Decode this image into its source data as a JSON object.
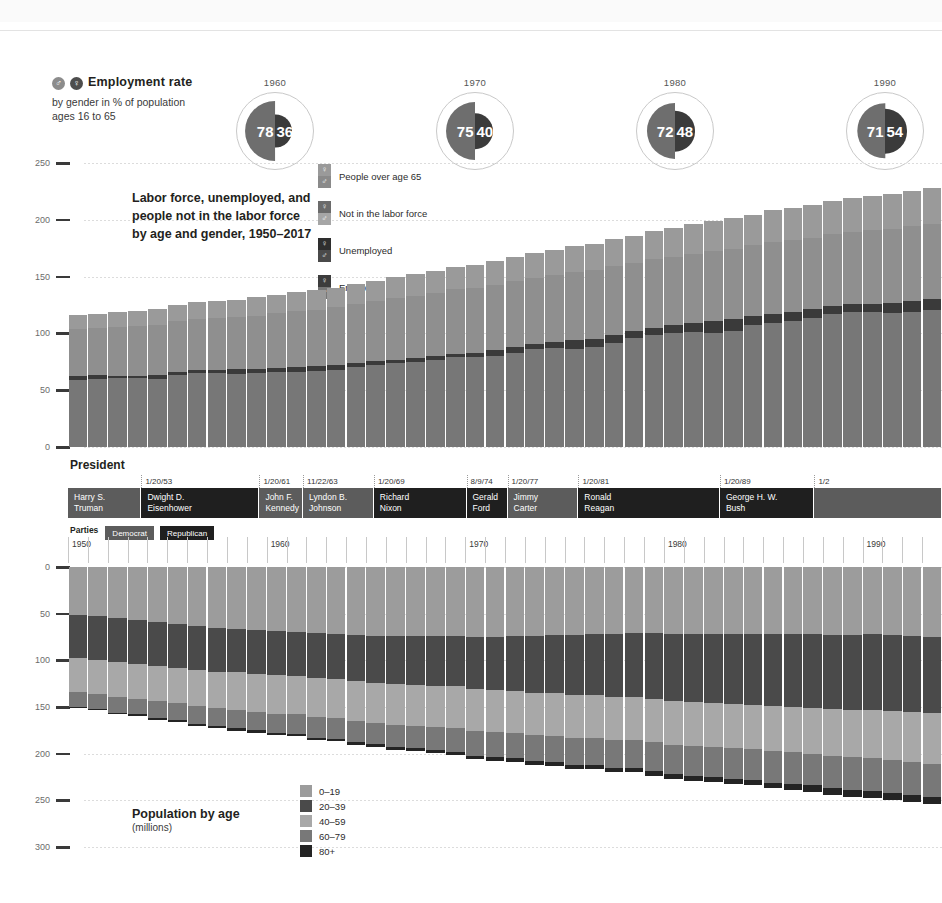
{
  "top_strip": {
    "ghost_text": ""
  },
  "employment": {
    "title": "Employment rate",
    "subtitle_line1": "by gender in % of population",
    "subtitle_line2": "ages 16 to 65",
    "male_icon": "♂",
    "female_icon": "♀",
    "male_color": "#6e6e6e",
    "female_color": "#3b3b3b",
    "entries": [
      {
        "year": "1960",
        "male": "78",
        "female": "36",
        "left": 229
      },
      {
        "year": "1970",
        "male": "75",
        "female": "40",
        "left": 429
      },
      {
        "year": "1980",
        "male": "72",
        "female": "48",
        "left": 629
      },
      {
        "year": "1990",
        "male": "71",
        "female": "54",
        "left": 839
      }
    ]
  },
  "top_chart": {
    "title_line1": "Labor force, unemployed, and",
    "title_line2": "people not in the labor force",
    "title_line3": "by age and gender, 1950–2017",
    "y_ticks": [
      "250",
      "200",
      "150",
      "100",
      "50",
      "0"
    ],
    "legend": [
      {
        "label": "People over age 65",
        "female_color": "#9a9a9a",
        "male_color": "#8a8a8a",
        "female_icon": "♀",
        "male_icon": "♂"
      },
      {
        "label": "Not in the labor force",
        "female_color": "#6b6b6b",
        "male_color": "#a6a6a6",
        "female_icon": "♀",
        "male_icon": "♂"
      },
      {
        "label": "Unemployed",
        "female_color": "#2e2e2e",
        "male_color": "#4a4a4a",
        "female_icon": "♀",
        "male_icon": "♂"
      },
      {
        "label": "Employed",
        "female_color": "#3c3c3c",
        "male_color": "#777777",
        "female_icon": "♀",
        "male_icon": "♂"
      }
    ]
  },
  "president": {
    "section_label": "President",
    "parties_label": "Parties",
    "party_legend": [
      {
        "name": "Democrat",
        "color": "#5c5c5c"
      },
      {
        "name": "Republican",
        "color": "#1f1f1f"
      }
    ],
    "terms": [
      {
        "name_line1": "Harry S.",
        "name_line2": "Truman",
        "party": "dem",
        "start_date": "",
        "width": 8.4
      },
      {
        "name_line1": "Dwight D.",
        "name_line2": "Eisenhower",
        "party": "rep",
        "start_date": "1/20/53",
        "width": 13.5
      },
      {
        "name_line1": "John F.",
        "name_line2": "Kennedy",
        "party": "dem",
        "start_date": "1/20/61",
        "width": 5.0
      },
      {
        "name_line1": "Lyndon B.",
        "name_line2": "Johnson",
        "party": "dem",
        "start_date": "11/22/63",
        "width": 8.1
      },
      {
        "name_line1": "Richard",
        "name_line2": "Nixon",
        "party": "rep",
        "start_date": "1/20/69",
        "width": 10.6
      },
      {
        "name_line1": "Gerald",
        "name_line2": "Ford",
        "party": "rep",
        "start_date": "8/9/74",
        "width": 4.7
      },
      {
        "name_line1": "Jimmy",
        "name_line2": "Carter",
        "party": "dem",
        "start_date": "1/20/77",
        "width": 8.1
      },
      {
        "name_line1": "Ronald",
        "name_line2": "Reagan",
        "party": "rep",
        "start_date": "1/20/81",
        "width": 16.2
      },
      {
        "name_line1": "George H. W.",
        "name_line2": "Bush",
        "party": "rep",
        "start_date": "1/20/89",
        "width": 10.8
      },
      {
        "name_line1": "",
        "name_line2": "",
        "party": "dem",
        "start_date": "1/2",
        "width": 14.6
      }
    ]
  },
  "bottom_chart": {
    "title": "Population by age",
    "units": "(millions)",
    "y_ticks": [
      "0",
      "50",
      "100",
      "150",
      "200",
      "250",
      "300"
    ],
    "decade_labels": [
      "1950",
      "1960",
      "1970",
      "1980",
      "1990"
    ],
    "legend": [
      {
        "label": "0–19",
        "color": "#9c9c9c"
      },
      {
        "label": "20–39",
        "color": "#4a4a4a"
      },
      {
        "label": "40–59",
        "color": "#a8a8a8"
      },
      {
        "label": "60–79",
        "color": "#787878"
      },
      {
        "label": "80+",
        "color": "#242424"
      }
    ]
  },
  "chart_data": [
    {
      "type": "bar",
      "id": "labor-force-stacked",
      "title": "Labor force, unemployed, and people not in the labor force by age and gender, 1950–2017",
      "subtitle": "",
      "xlabel": "",
      "ylabel": "millions of people",
      "ylim": [
        0,
        250
      ],
      "grid": true,
      "legend_position": "inside-top-left",
      "stacked": true,
      "orientation": "vertical-up",
      "categories": [
        1950,
        1951,
        1952,
        1953,
        1954,
        1955,
        1956,
        1957,
        1958,
        1959,
        1960,
        1961,
        1962,
        1963,
        1964,
        1965,
        1966,
        1967,
        1968,
        1969,
        1970,
        1971,
        1972,
        1973,
        1974,
        1975,
        1976,
        1977,
        1978,
        1979,
        1980,
        1981,
        1982,
        1983,
        1984,
        1985,
        1986,
        1987,
        1988,
        1989,
        1990,
        1991,
        1992,
        1993
      ],
      "series": [
        {
          "name": "Employed",
          "color": "#777777",
          "values": [
            59,
            60,
            61,
            61,
            60,
            63,
            65,
            65,
            64,
            65,
            66,
            66,
            67,
            68,
            70,
            72,
            74,
            75,
            77,
            79,
            79,
            80,
            83,
            86,
            87,
            86,
            88,
            92,
            96,
            99,
            100,
            101,
            100,
            102,
            107,
            109,
            111,
            114,
            117,
            119,
            119,
            118,
            119,
            121
          ]
        },
        {
          "name": "Unemployed",
          "color": "#3a3a3a",
          "values": [
            3.3,
            3.1,
            1.9,
            1.8,
            3.5,
            2.9,
            2.8,
            2.9,
            4.6,
            3.7,
            3.9,
            4.7,
            3.9,
            4.1,
            3.8,
            3.4,
            2.9,
            3.0,
            2.8,
            2.8,
            4.1,
            5.0,
            4.9,
            4.4,
            5.2,
            7.9,
            7.4,
            7.0,
            6.2,
            6.1,
            7.6,
            8.3,
            10.7,
            10.7,
            8.5,
            8.3,
            8.2,
            7.4,
            6.7,
            6.5,
            7.0,
            8.6,
            9.6,
            8.9
          ]
        },
        {
          "name": "Not in the labor force",
          "color": "#8f8f8f",
          "values": [
            42,
            42,
            43,
            44,
            44,
            45,
            45,
            46,
            46,
            47,
            48,
            49,
            50,
            51,
            52,
            53,
            54,
            55,
            56,
            57,
            57,
            58,
            58,
            58,
            59,
            60,
            60,
            60,
            60,
            60,
            60,
            61,
            62,
            62,
            62,
            63,
            63,
            63,
            64,
            64,
            65,
            65,
            66,
            66
          ]
        },
        {
          "name": "People over age 65",
          "color": "#9a9a9a",
          "values": [
            12,
            12,
            13,
            13,
            14,
            14,
            15,
            15,
            15,
            16,
            16,
            17,
            17,
            17,
            18,
            18,
            19,
            19,
            19,
            20,
            20,
            21,
            21,
            22,
            22,
            23,
            23,
            24,
            24,
            25,
            25,
            26,
            26,
            27,
            27,
            28,
            28,
            29,
            29,
            30,
            30,
            31,
            31,
            32
          ]
        }
      ]
    },
    {
      "type": "bar",
      "id": "population-by-age",
      "title": "Population by age",
      "subtitle": "(millions)",
      "xlabel": "",
      "ylabel": "millions",
      "ylim": [
        0,
        300
      ],
      "y_inverted": true,
      "grid": true,
      "legend_position": "inside-bottom-center",
      "stacked": true,
      "orientation": "vertical-down",
      "categories": [
        1950,
        1951,
        1952,
        1953,
        1954,
        1955,
        1956,
        1957,
        1958,
        1959,
        1960,
        1961,
        1962,
        1963,
        1964,
        1965,
        1966,
        1967,
        1968,
        1969,
        1970,
        1971,
        1972,
        1973,
        1974,
        1975,
        1976,
        1977,
        1978,
        1979,
        1980,
        1981,
        1982,
        1983,
        1984,
        1985,
        1986,
        1987,
        1988,
        1989,
        1990,
        1991,
        1992,
        1993
      ],
      "series": [
        {
          "name": "0–19",
          "color": "#9c9c9c",
          "values": [
            51,
            53,
            55,
            57,
            59,
            61,
            63,
            65,
            66,
            68,
            69,
            70,
            71,
            72,
            73,
            74,
            74,
            74,
            74,
            74,
            75,
            75,
            74,
            74,
            73,
            73,
            72,
            72,
            71,
            71,
            72,
            72,
            72,
            72,
            72,
            72,
            72,
            72,
            73,
            73,
            72,
            73,
            74,
            75
          ]
        },
        {
          "name": "20–39",
          "color": "#4a4a4a",
          "values": [
            47,
            47,
            47,
            47,
            47,
            47,
            47,
            47,
            47,
            47,
            47,
            47,
            48,
            48,
            49,
            50,
            51,
            52,
            53,
            54,
            56,
            57,
            59,
            61,
            62,
            64,
            65,
            67,
            68,
            70,
            72,
            73,
            74,
            75,
            76,
            77,
            78,
            79,
            79,
            80,
            81,
            81,
            81,
            81
          ]
        },
        {
          "name": "40–59",
          "color": "#a8a8a8",
          "values": [
            36,
            36,
            37,
            37,
            38,
            38,
            39,
            39,
            40,
            40,
            41,
            41,
            42,
            42,
            43,
            43,
            44,
            44,
            44,
            45,
            45,
            45,
            45,
            45,
            46,
            46,
            46,
            46,
            46,
            47,
            47,
            47,
            47,
            47,
            47,
            48,
            48,
            49,
            50,
            51,
            52,
            53,
            54,
            55
          ]
        },
        {
          "name": "60–79",
          "color": "#787878",
          "values": [
            16,
            16,
            17,
            17,
            18,
            18,
            19,
            19,
            20,
            20,
            21,
            21,
            22,
            22,
            23,
            23,
            24,
            24,
            25,
            25,
            26,
            27,
            27,
            28,
            28,
            29,
            29,
            30,
            30,
            31,
            31,
            32,
            32,
            33,
            33,
            34,
            34,
            34,
            35,
            35,
            35,
            35,
            35,
            35
          ]
        },
        {
          "name": "80+",
          "color": "#242424",
          "values": [
            1.6,
            1.7,
            1.7,
            1.8,
            1.9,
            2.0,
            2.1,
            2.2,
            2.3,
            2.4,
            2.5,
            2.6,
            2.7,
            2.8,
            2.9,
            3.0,
            3.1,
            3.2,
            3.3,
            3.5,
            3.6,
            3.8,
            3.9,
            4.1,
            4.2,
            4.4,
            4.6,
            4.7,
            4.9,
            5.1,
            5.3,
            5.5,
            5.7,
            5.9,
            6.1,
            6.3,
            6.5,
            6.7,
            6.9,
            7.1,
            7.3,
            7.5,
            7.7,
            7.9
          ]
        }
      ]
    }
  ]
}
